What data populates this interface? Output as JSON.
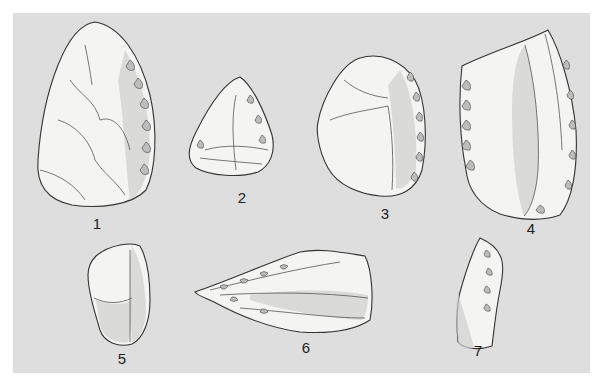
{
  "figure": {
    "background_color": "#dedede",
    "artifacts": [
      {
        "number": "1",
        "description": "ovate handaxe"
      },
      {
        "number": "2",
        "description": "triangular point"
      },
      {
        "number": "3",
        "description": "retouched scraper"
      },
      {
        "number": "4",
        "description": "large side scraper"
      },
      {
        "number": "5",
        "description": "core fragment"
      },
      {
        "number": "6",
        "description": "elongated point"
      },
      {
        "number": "7",
        "description": "denticulate flake"
      }
    ]
  }
}
